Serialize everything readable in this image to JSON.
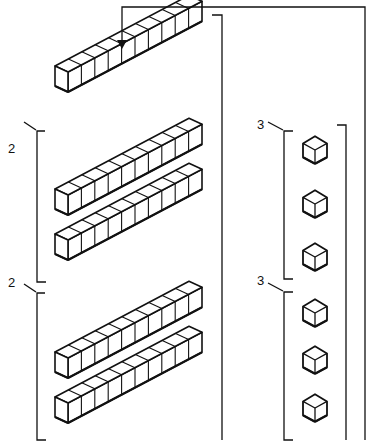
{
  "diagram": {
    "type": "base-ten blocks regrouping",
    "colors": {
      "stroke": "#111111",
      "background": "#ffffff",
      "face": "#ffffff"
    },
    "arrow": {
      "description": "arrow from right column loops over top and points down onto the top rod"
    },
    "rods": {
      "count": 5,
      "cubes_per_rod": 10,
      "items": [
        {
          "id": "rod-top",
          "x": 55,
          "y": 92
        },
        {
          "id": "rod-group1-a",
          "x": 55,
          "y": 215
        },
        {
          "id": "rod-group1-b",
          "x": 55,
          "y": 260
        },
        {
          "id": "rod-group2-a",
          "x": 55,
          "y": 378
        },
        {
          "id": "rod-group2-b",
          "x": 55,
          "y": 423
        }
      ]
    },
    "rod_groups": [
      {
        "label": "2",
        "label_x": 8,
        "label_y": 142
      },
      {
        "label": "2",
        "label_x": 8,
        "label_y": 276
      }
    ],
    "unit_cubes": {
      "count": 6,
      "items": [
        {
          "id": "unit-1",
          "cx": 315,
          "cy": 150
        },
        {
          "id": "unit-2",
          "cx": 315,
          "cy": 204
        },
        {
          "id": "unit-3",
          "cx": 315,
          "cy": 257
        },
        {
          "id": "unit-4",
          "cx": 315,
          "cy": 313
        },
        {
          "id": "unit-5",
          "cx": 315,
          "cy": 360
        },
        {
          "id": "unit-6",
          "cx": 315,
          "cy": 408
        }
      ]
    },
    "unit_groups": [
      {
        "label": "3",
        "label_x": 257,
        "label_y": 118
      },
      {
        "label": "3",
        "label_x": 257,
        "label_y": 274
      }
    ]
  }
}
